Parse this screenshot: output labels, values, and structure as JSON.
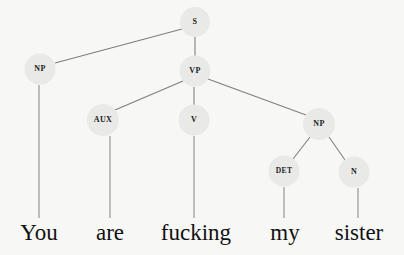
{
  "diagram": {
    "type": "syntax-tree",
    "background_color": "#f7f7f5",
    "node_fill_color": "#e9e9e7",
    "edge_color": "#7d7d7d",
    "text_color": "#1c1c1c",
    "sentence": "You are fucking my sister"
  },
  "nodes": [
    {
      "id": "s",
      "label": "S",
      "cx": 195,
      "cy": 22,
      "r": 15,
      "font_size": 8
    },
    {
      "id": "np1",
      "label": "NP",
      "cx": 40,
      "cy": 69,
      "r": 15.5,
      "font_size": 8
    },
    {
      "id": "vp",
      "label": "VP",
      "cx": 195,
      "cy": 71,
      "r": 15.5,
      "font_size": 8
    },
    {
      "id": "aux",
      "label": "AUX",
      "cx": 103,
      "cy": 120,
      "r": 16,
      "font_size": 8
    },
    {
      "id": "v",
      "label": "V",
      "cx": 194,
      "cy": 120,
      "r": 15.5,
      "font_size": 8
    },
    {
      "id": "np2",
      "label": "NP",
      "cx": 319,
      "cy": 124,
      "r": 16,
      "font_size": 8
    },
    {
      "id": "det",
      "label": "DET",
      "cx": 284,
      "cy": 171,
      "r": 15.5,
      "font_size": 7.5
    },
    {
      "id": "n",
      "label": "N",
      "cx": 354,
      "cy": 172,
      "r": 15.5,
      "font_size": 8
    }
  ],
  "edges": [
    {
      "id": "s-np1",
      "from": "s",
      "to": "np1",
      "x1": 182,
      "y1": 29,
      "x2": 55,
      "y2": 63
    },
    {
      "id": "s-vp",
      "from": "s",
      "to": "vp",
      "x1": 195,
      "y1": 37,
      "x2": 195,
      "y2": 56
    },
    {
      "id": "vp-aux",
      "from": "vp",
      "to": "aux",
      "x1": 183,
      "y1": 81,
      "x2": 115,
      "y2": 110
    },
    {
      "id": "vp-v",
      "from": "vp",
      "to": "v",
      "x1": 194,
      "y1": 87,
      "x2": 194,
      "y2": 105
    },
    {
      "id": "vp-np2",
      "from": "vp",
      "to": "np2",
      "x1": 208,
      "y1": 79,
      "x2": 306,
      "y2": 115
    },
    {
      "id": "np2-det",
      "from": "np2",
      "to": "det",
      "x1": 310,
      "y1": 137,
      "x2": 293,
      "y2": 159
    },
    {
      "id": "np2-n",
      "from": "np2",
      "to": "n",
      "x1": 329,
      "y1": 137,
      "x2": 345,
      "y2": 160
    }
  ],
  "terminals": [
    {
      "id": "term-you",
      "word": "You",
      "node": "np1",
      "x": 39,
      "line_top": 85,
      "line_bottom": 218,
      "text_x": 39,
      "text_y": 240
    },
    {
      "id": "term-are",
      "word": "are",
      "node": "aux",
      "x": 110,
      "line_top": 136,
      "line_bottom": 218,
      "text_x": 110,
      "text_y": 240
    },
    {
      "id": "term-fucking",
      "word": "fucking",
      "node": "v",
      "x": 194,
      "line_top": 136,
      "line_bottom": 218,
      "text_x": 196,
      "text_y": 240
    },
    {
      "id": "term-my",
      "word": "my",
      "node": "det",
      "x": 284,
      "line_top": 187,
      "line_bottom": 218,
      "text_x": 285,
      "text_y": 240
    },
    {
      "id": "term-sister",
      "word": "sister",
      "node": "n",
      "x": 358,
      "line_top": 188,
      "line_bottom": 218,
      "text_x": 359,
      "text_y": 240
    }
  ]
}
